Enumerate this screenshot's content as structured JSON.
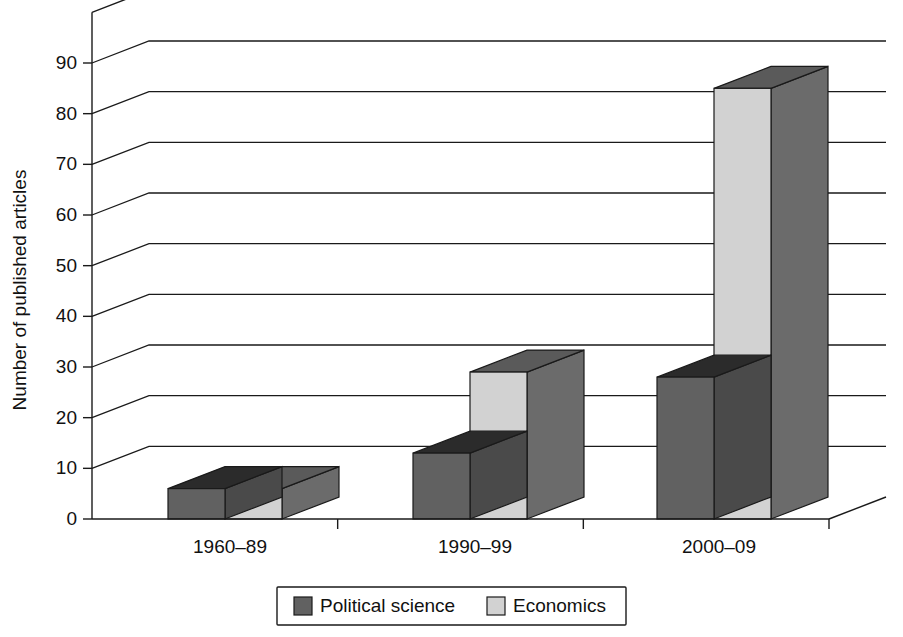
{
  "chart_data": {
    "type": "bar",
    "title": "",
    "subtitle": "",
    "xlabel": "",
    "ylabel": "Number of published articles",
    "categories": [
      "1960–89",
      "1990–99",
      "2000–09"
    ],
    "series": [
      {
        "name": "Political science",
        "values": [
          6,
          13,
          28
        ],
        "color": "#616161"
      },
      {
        "name": "Economics",
        "values": [
          6,
          29,
          85
        ],
        "color": "#d2d2d2"
      }
    ],
    "ylim": [
      0,
      90
    ],
    "ytick_labels": [
      "0",
      "10",
      "20",
      "30",
      "40",
      "50",
      "60",
      "70",
      "80",
      "90"
    ],
    "ytick_values": [
      0,
      10,
      20,
      30,
      40,
      50,
      60,
      70,
      80,
      90
    ],
    "grid": true,
    "grid_orientation": "horizontal",
    "legend_position": "bottom",
    "three_d": true,
    "style": {
      "background": "#ffffff",
      "line_color": "#1a1a1a",
      "text_color": "#111111",
      "series1_front": "#616161",
      "series1_side": "#4a4a4a",
      "series1_top": "#2b2b2b",
      "series2_front": "#d2d2d2",
      "series2_side": "#6b6b6b",
      "series2_top": "#5a5a5a"
    }
  },
  "legend": {
    "items": [
      {
        "label": "Political science",
        "swatch_color": "#616161"
      },
      {
        "label": "Economics",
        "swatch_color": "#d2d2d2"
      }
    ]
  },
  "axes": {
    "y_title": "Number of published articles",
    "y_ticks": [
      "0",
      "10",
      "20",
      "30",
      "40",
      "50",
      "60",
      "70",
      "80",
      "90"
    ],
    "x_ticks": [
      "1960–89",
      "1990–99",
      "2000–09"
    ]
  }
}
